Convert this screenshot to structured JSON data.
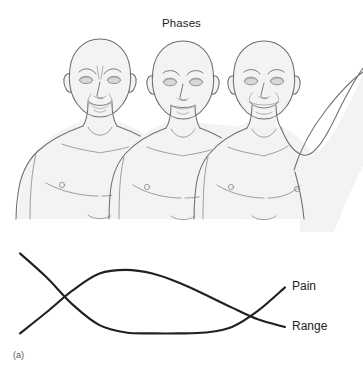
{
  "figure": {
    "title": "Phases",
    "panel_letter": "(a)",
    "background_color": "#ffffff",
    "curve_color": "#231f20",
    "body_outline_color": "#6d6e71",
    "body_fill_color": "#f3f3f4"
  },
  "figures": [
    {
      "name": "patient-acute-phase",
      "expression": "grimacing",
      "arm_position": "arms-down",
      "order": 1
    },
    {
      "name": "patient-subacute-phase",
      "expression": "neutral",
      "arm_position": "arms-down",
      "order": 2
    },
    {
      "name": "patient-recovery-phase",
      "expression": "smiling",
      "arm_position": "arm-raised",
      "order": 3
    }
  ],
  "labels": {
    "range": "Range",
    "pain": "Pain"
  },
  "chart_data": {
    "type": "line",
    "title": "Phases",
    "xlabel": "",
    "ylabel": "",
    "grid": false,
    "legend": "inline-right",
    "xlim": [
      0,
      100
    ],
    "ylim": [
      0,
      100
    ],
    "x": [
      0,
      10,
      20,
      30,
      40,
      50,
      60,
      70,
      80,
      90,
      100
    ],
    "series": [
      {
        "name": "Range",
        "label": "Range",
        "color": "#231f20",
        "values": [
          5,
          28,
          52,
          70,
          74,
          70,
          60,
          47,
          33,
          20,
          12
        ]
      },
      {
        "name": "Pain",
        "label": "Pain",
        "color": "#231f20",
        "values": [
          92,
          66,
          36,
          14,
          6,
          5,
          5,
          6,
          12,
          30,
          55
        ]
      }
    ],
    "annotations": [
      {
        "text": "Range",
        "x": 100,
        "y": 12
      },
      {
        "text": "Pain",
        "x": 100,
        "y": 55
      }
    ],
    "crossings": [
      {
        "x": 13,
        "y": 40
      },
      {
        "x": 62,
        "y": 52
      }
    ]
  }
}
